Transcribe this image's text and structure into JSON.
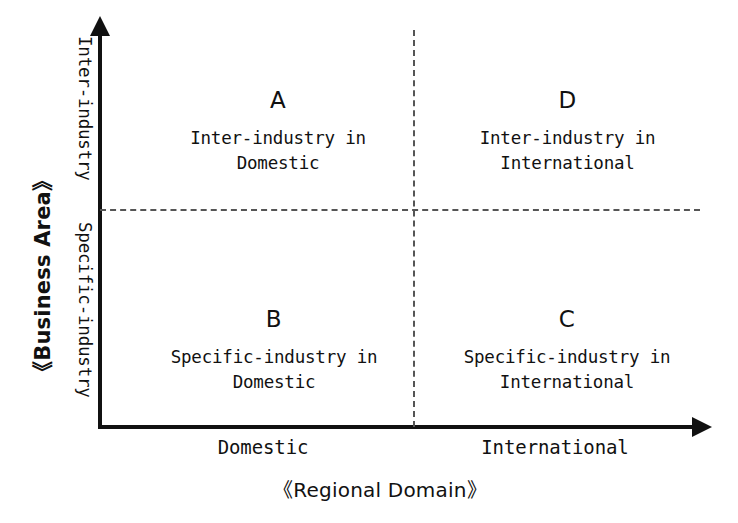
{
  "diagram": {
    "type": "2x2-matrix",
    "x_axis": {
      "title": "《Regional Domain》",
      "ticks": [
        "Domestic",
        "International"
      ]
    },
    "y_axis": {
      "title": "《Business Area》",
      "ticks": [
        "Inter-industry",
        "Specific-industry"
      ]
    },
    "quadrants": [
      {
        "key": "A",
        "letter": "A",
        "line1": "Inter-industry in",
        "line2": "Domestic",
        "x": "Domestic",
        "y": "Inter-industry"
      },
      {
        "key": "D",
        "letter": "D",
        "line1": "Inter-industry in",
        "line2": "International",
        "x": "International",
        "y": "Inter-industry"
      },
      {
        "key": "B",
        "letter": "B",
        "line1": "Specific-industry in",
        "line2": "Domestic",
        "x": "Domestic",
        "y": "Specific-industry"
      },
      {
        "key": "C",
        "letter": "C",
        "line1": "Specific-industry in",
        "line2": "International",
        "x": "International",
        "y": "Specific-industry"
      }
    ],
    "colors": {
      "background": "#ffffff",
      "ink": "#111111",
      "divider": "#555555"
    }
  }
}
